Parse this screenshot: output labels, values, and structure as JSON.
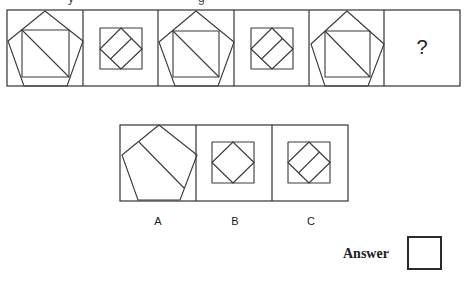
{
  "puzzle": {
    "question_mark": "?",
    "sequence_cells": [
      {
        "index": 1,
        "type": "pentagon-square-diagonal"
      },
      {
        "index": 2,
        "type": "square-diamond-line"
      },
      {
        "index": 3,
        "type": "pentagon-square-diagonal"
      },
      {
        "index": 4,
        "type": "square-diamond-line"
      },
      {
        "index": 5,
        "type": "pentagon-square-diagonal"
      },
      {
        "index": 6,
        "type": "unknown"
      }
    ],
    "options": [
      {
        "label": "A",
        "type": "pentagon-line"
      },
      {
        "label": "B",
        "type": "square-diamond"
      },
      {
        "label": "C",
        "type": "square-diamond-line"
      }
    ],
    "answer": {
      "label": "Answer",
      "value": ""
    }
  },
  "colors": {
    "stroke": "#333333",
    "background": "#ffffff"
  }
}
